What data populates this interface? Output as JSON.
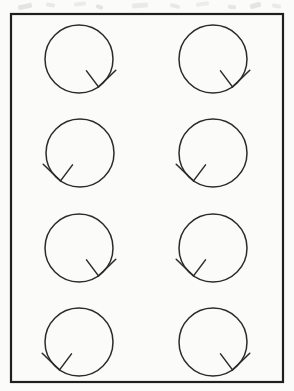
{
  "figure": {
    "background_color": "#fbfbfa",
    "ink_color": "#2b2b2b",
    "border": {
      "x": 11,
      "y": 14,
      "width": 272,
      "height": 368,
      "stroke_width": 2.2,
      "color": "#1f1f1f"
    },
    "grid": {
      "columns": 2,
      "rows": 4,
      "column_centers_x": [
        79,
        213
      ],
      "row_centers_y": [
        59,
        153,
        248,
        342
      ],
      "circle_radius": 34,
      "circle_stroke_width": 1.5
    },
    "arrowhead": {
      "stroke_width": 1.5,
      "inner_barb_length": 20,
      "outer_barb_length": 24,
      "right_tip_angle_deg": 55,
      "left_tip_angle_deg": 125
    },
    "items": [
      {
        "id": "circle-r1c1",
        "row": 1,
        "column": 1,
        "cx": 79,
        "cy": 59,
        "r": 34,
        "arrow_side": "right",
        "direction": "clockwise"
      },
      {
        "id": "circle-r1c2",
        "row": 1,
        "column": 2,
        "cx": 213,
        "cy": 59,
        "r": 34,
        "arrow_side": "right",
        "direction": "clockwise"
      },
      {
        "id": "circle-r2c1",
        "row": 2,
        "column": 1,
        "cx": 80,
        "cy": 153,
        "r": 34,
        "arrow_side": "left",
        "direction": "counter-clockwise"
      },
      {
        "id": "circle-r2c2",
        "row": 2,
        "column": 2,
        "cx": 213,
        "cy": 153,
        "r": 34,
        "arrow_side": "left",
        "direction": "counter-clockwise"
      },
      {
        "id": "circle-r3c1",
        "row": 3,
        "column": 1,
        "cx": 79,
        "cy": 248,
        "r": 34,
        "arrow_side": "right",
        "direction": "clockwise"
      },
      {
        "id": "circle-r3c2",
        "row": 3,
        "column": 2,
        "cx": 213,
        "cy": 248,
        "r": 34,
        "arrow_side": "left",
        "direction": "counter-clockwise"
      },
      {
        "id": "circle-r4c1",
        "row": 4,
        "column": 1,
        "cx": 79,
        "cy": 342,
        "r": 34,
        "arrow_side": "left",
        "direction": "counter-clockwise"
      },
      {
        "id": "circle-r4c2",
        "row": 4,
        "column": 2,
        "cx": 213,
        "cy": 342,
        "r": 34,
        "arrow_side": "right",
        "direction": "clockwise"
      }
    ],
    "scan_marks": [
      {
        "x": 18,
        "y": 4,
        "width": 14,
        "height": 5,
        "rotation": -12,
        "opacity": 0.2
      },
      {
        "x": 46,
        "y": 3,
        "width": 9,
        "height": 4,
        "rotation": 8,
        "opacity": 0.16
      },
      {
        "x": 74,
        "y": 2,
        "width": 12,
        "height": 4,
        "rotation": -6,
        "opacity": 0.14
      },
      {
        "x": 96,
        "y": 5,
        "width": 7,
        "height": 4,
        "rotation": 20,
        "opacity": 0.22
      },
      {
        "x": 132,
        "y": 3,
        "width": 16,
        "height": 5,
        "rotation": -4,
        "opacity": 0.15
      },
      {
        "x": 170,
        "y": 4,
        "width": 10,
        "height": 4,
        "rotation": 14,
        "opacity": 0.17
      },
      {
        "x": 196,
        "y": 2,
        "width": 13,
        "height": 4,
        "rotation": -9,
        "opacity": 0.13
      },
      {
        "x": 228,
        "y": 5,
        "width": 8,
        "height": 4,
        "rotation": 6,
        "opacity": 0.19
      },
      {
        "x": 250,
        "y": 3,
        "width": 11,
        "height": 5,
        "rotation": -16,
        "opacity": 0.21
      },
      {
        "x": 272,
        "y": 4,
        "width": 9,
        "height": 4,
        "rotation": 10,
        "opacity": 0.15
      }
    ]
  }
}
